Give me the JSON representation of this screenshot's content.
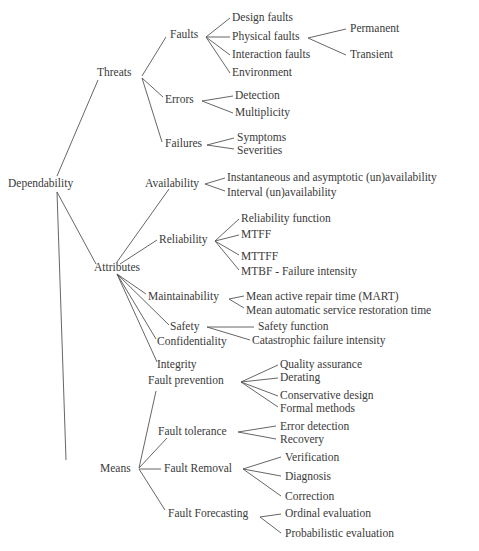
{
  "diagram": {
    "type": "tree",
    "title": "Dependability",
    "colors": {
      "text": "#3a3a3a",
      "lines": "#555555",
      "background": "#ffffff"
    },
    "nodes": [
      {
        "id": "dependability",
        "label": "Dependability",
        "x": 8,
        "y": 184
      },
      {
        "id": "threats",
        "label": "Threats",
        "x": 97,
        "y": 73
      },
      {
        "id": "faults",
        "label": "Faults",
        "x": 170,
        "y": 35
      },
      {
        "id": "design_faults",
        "label": "Design faults",
        "x": 232,
        "y": 18
      },
      {
        "id": "physical_faults",
        "label": "Physical faults",
        "x": 232,
        "y": 37
      },
      {
        "id": "interaction_faults",
        "label": "Interaction faults",
        "x": 232,
        "y": 55
      },
      {
        "id": "environment",
        "label": "Environment",
        "x": 232,
        "y": 73
      },
      {
        "id": "permanent",
        "label": "Permanent",
        "x": 350,
        "y": 29
      },
      {
        "id": "transient",
        "label": "Transient",
        "x": 350,
        "y": 55
      },
      {
        "id": "errors",
        "label": "Errors",
        "x": 165,
        "y": 100
      },
      {
        "id": "detection",
        "label": "Detection",
        "x": 235,
        "y": 96
      },
      {
        "id": "multiplicity",
        "label": "Multiplicity",
        "x": 235,
        "y": 113
      },
      {
        "id": "failures",
        "label": "Failures",
        "x": 165,
        "y": 144
      },
      {
        "id": "symptoms",
        "label": "Symptoms",
        "x": 237,
        "y": 138
      },
      {
        "id": "severities",
        "label": "Severities",
        "x": 237,
        "y": 151
      },
      {
        "id": "attributes",
        "label": "Attributes",
        "x": 94,
        "y": 268
      },
      {
        "id": "availability",
        "label": "Availability",
        "x": 145,
        "y": 184
      },
      {
        "id": "inst_avail",
        "label": "Instantaneous  and asymptotic (un)availability",
        "x": 227,
        "y": 178
      },
      {
        "id": "interval_avail",
        "label": "Interval (un)availability",
        "x": 227,
        "y": 193
      },
      {
        "id": "reliability",
        "label": "Reliability",
        "x": 159,
        "y": 240
      },
      {
        "id": "rel_function",
        "label": "Reliability function",
        "x": 241,
        "y": 219
      },
      {
        "id": "mtff",
        "label": "MTFF",
        "x": 241,
        "y": 235
      },
      {
        "id": "mttff",
        "label": "MTTFF",
        "x": 241,
        "y": 257
      },
      {
        "id": "mtbf",
        "label": "MTBF - Failure intensity",
        "x": 241,
        "y": 272
      },
      {
        "id": "maintainability",
        "label": "Maintainability",
        "x": 148,
        "y": 297
      },
      {
        "id": "mart",
        "label": "Mean active repair time (MART)",
        "x": 246,
        "y": 297
      },
      {
        "id": "mean_auto",
        "label": "Mean automatic service restoration time",
        "x": 246,
        "y": 311
      },
      {
        "id": "safety",
        "label": "Safety",
        "x": 170,
        "y": 327
      },
      {
        "id": "safety_function",
        "label": "Safety function",
        "x": 258,
        "y": 327
      },
      {
        "id": "catastrophic",
        "label": "Catastrophic failure intensity",
        "x": 252,
        "y": 341
      },
      {
        "id": "confidentiality",
        "label": "Confidentiality",
        "x": 157,
        "y": 342
      },
      {
        "id": "integrity",
        "label": "Integrity",
        "x": 157,
        "y": 365
      },
      {
        "id": "means",
        "label": "Means",
        "x": 100,
        "y": 469
      },
      {
        "id": "fault_prevention",
        "label": "Fault prevention",
        "x": 148,
        "y": 381
      },
      {
        "id": "quality_assurance",
        "label": "Quality assurance",
        "x": 280,
        "y": 365
      },
      {
        "id": "derating",
        "label": "Derating",
        "x": 280,
        "y": 378
      },
      {
        "id": "conservative_design",
        "label": "Conservative design",
        "x": 280,
        "y": 396
      },
      {
        "id": "formal_methods",
        "label": "Formal methods",
        "x": 280,
        "y": 409
      },
      {
        "id": "fault_tolerance",
        "label": "Fault tolerance",
        "x": 158,
        "y": 432
      },
      {
        "id": "error_detection",
        "label": "Error detection",
        "x": 280,
        "y": 427
      },
      {
        "id": "recovery",
        "label": "Recovery",
        "x": 280,
        "y": 440
      },
      {
        "id": "fault_removal",
        "label": "Fault Removal",
        "x": 164,
        "y": 469
      },
      {
        "id": "verification",
        "label": "Verification",
        "x": 285,
        "y": 458
      },
      {
        "id": "diagnosis",
        "label": "Diagnosis",
        "x": 285,
        "y": 477
      },
      {
        "id": "correction",
        "label": "Correction",
        "x": 285,
        "y": 497
      },
      {
        "id": "fault_forecasting",
        "label": "Fault Forecasting",
        "x": 168,
        "y": 514
      },
      {
        "id": "ordinal_eval",
        "label": "Ordinal evaluation",
        "x": 285,
        "y": 514
      },
      {
        "id": "probabilistic_eval",
        "label": "Probabilistic evaluation",
        "x": 285,
        "y": 534
      }
    ],
    "edges": [
      {
        "from": "dependability",
        "to": "threats",
        "x1": 57,
        "y1": 176,
        "x2": 98,
        "y2": 80
      },
      {
        "from": "dependability",
        "to": "attributes",
        "x1": 57,
        "y1": 192,
        "x2": 96,
        "y2": 264
      },
      {
        "from": "dependability",
        "to": "means",
        "x1": 57,
        "y1": 192,
        "x2": 66,
        "y2": 460
      },
      {
        "from": "threats",
        "to": "faults",
        "x1": 142,
        "y1": 76,
        "x2": 166,
        "y2": 37
      },
      {
        "from": "threats",
        "to": "errors",
        "x1": 142,
        "y1": 78,
        "x2": 163,
        "y2": 97
      },
      {
        "from": "threats",
        "to": "failures",
        "x1": 142,
        "y1": 78,
        "x2": 162,
        "y2": 142
      },
      {
        "from": "faults",
        "to": "design_faults",
        "x1": 206,
        "y1": 37,
        "x2": 230,
        "y2": 18
      },
      {
        "from": "faults",
        "to": "physical_faults",
        "x1": 206,
        "y1": 37,
        "x2": 230,
        "y2": 37
      },
      {
        "from": "faults",
        "to": "interaction_faults",
        "x1": 206,
        "y1": 37,
        "x2": 230,
        "y2": 55
      },
      {
        "from": "faults",
        "to": "environment",
        "x1": 206,
        "y1": 37,
        "x2": 230,
        "y2": 73
      },
      {
        "from": "physical_faults",
        "to": "permanent",
        "x1": 308,
        "y1": 38,
        "x2": 346,
        "y2": 29
      },
      {
        "from": "physical_faults",
        "to": "transient",
        "x1": 308,
        "y1": 38,
        "x2": 346,
        "y2": 55
      },
      {
        "from": "errors",
        "to": "detection",
        "x1": 202,
        "y1": 101,
        "x2": 233,
        "y2": 96
      },
      {
        "from": "errors",
        "to": "multiplicity",
        "x1": 202,
        "y1": 101,
        "x2": 233,
        "y2": 113
      },
      {
        "from": "failures",
        "to": "symptoms",
        "x1": 207,
        "y1": 145,
        "x2": 234,
        "y2": 138
      },
      {
        "from": "failures",
        "to": "severities",
        "x1": 207,
        "y1": 145,
        "x2": 234,
        "y2": 149
      },
      {
        "from": "attributes",
        "to": "availability",
        "x1": 117,
        "y1": 262,
        "x2": 169,
        "y2": 189
      },
      {
        "from": "attributes",
        "to": "reliability",
        "x1": 120,
        "y1": 264,
        "x2": 157,
        "y2": 240
      },
      {
        "from": "attributes",
        "to": "maintainability",
        "x1": 117,
        "y1": 274,
        "x2": 146,
        "y2": 294
      },
      {
        "from": "attributes",
        "to": "safety",
        "x1": 117,
        "y1": 274,
        "x2": 169,
        "y2": 325
      },
      {
        "from": "attributes",
        "to": "confidentiality",
        "x1": 117,
        "y1": 274,
        "x2": 156,
        "y2": 339
      },
      {
        "from": "attributes",
        "to": "integrity",
        "x1": 117,
        "y1": 274,
        "x2": 157,
        "y2": 362
      },
      {
        "from": "availability",
        "to": "inst_avail",
        "x1": 205,
        "y1": 184,
        "x2": 225,
        "y2": 178
      },
      {
        "from": "availability",
        "to": "interval_avail",
        "x1": 205,
        "y1": 184,
        "x2": 225,
        "y2": 191
      },
      {
        "from": "reliability",
        "to": "rel_function",
        "x1": 215,
        "y1": 241,
        "x2": 239,
        "y2": 219
      },
      {
        "from": "reliability",
        "to": "mtff",
        "x1": 215,
        "y1": 241,
        "x2": 239,
        "y2": 235
      },
      {
        "from": "reliability",
        "to": "mttff",
        "x1": 215,
        "y1": 241,
        "x2": 239,
        "y2": 255
      },
      {
        "from": "reliability",
        "to": "mtbf",
        "x1": 215,
        "y1": 241,
        "x2": 239,
        "y2": 270
      },
      {
        "from": "maintainability",
        "to": "mart",
        "x1": 229,
        "y1": 299,
        "x2": 244,
        "y2": 296
      },
      {
        "from": "maintainability",
        "to": "mean_auto",
        "x1": 229,
        "y1": 299,
        "x2": 244,
        "y2": 308
      },
      {
        "from": "safety",
        "to": "safety_function",
        "x1": 207,
        "y1": 327,
        "x2": 254,
        "y2": 327
      },
      {
        "from": "safety",
        "to": "catastrophic",
        "x1": 207,
        "y1": 327,
        "x2": 250,
        "y2": 340
      },
      {
        "from": "means",
        "to": "fault_prevention",
        "x1": 139,
        "y1": 468,
        "x2": 156,
        "y2": 391
      },
      {
        "from": "means",
        "to": "fault_tolerance",
        "x1": 139,
        "y1": 468,
        "x2": 167,
        "y2": 438
      },
      {
        "from": "means",
        "to": "fault_removal",
        "x1": 139,
        "y1": 469,
        "x2": 161,
        "y2": 469
      },
      {
        "from": "means",
        "to": "fault_forecasting",
        "x1": 139,
        "y1": 469,
        "x2": 165,
        "y2": 510
      },
      {
        "from": "fault_prevention",
        "to": "quality_assurance",
        "x1": 241,
        "y1": 382,
        "x2": 278,
        "y2": 365
      },
      {
        "from": "fault_prevention",
        "to": "derating",
        "x1": 241,
        "y1": 382,
        "x2": 278,
        "y2": 378
      },
      {
        "from": "fault_prevention",
        "to": "conservative_design",
        "x1": 241,
        "y1": 382,
        "x2": 278,
        "y2": 396
      },
      {
        "from": "fault_prevention",
        "to": "formal_methods",
        "x1": 241,
        "y1": 382,
        "x2": 278,
        "y2": 407
      },
      {
        "from": "fault_tolerance",
        "to": "error_detection",
        "x1": 238,
        "y1": 432,
        "x2": 276,
        "y2": 426
      },
      {
        "from": "fault_tolerance",
        "to": "recovery",
        "x1": 238,
        "y1": 432,
        "x2": 276,
        "y2": 439
      },
      {
        "from": "fault_removal",
        "to": "verification",
        "x1": 243,
        "y1": 469,
        "x2": 281,
        "y2": 457
      },
      {
        "from": "fault_removal",
        "to": "diagnosis",
        "x1": 243,
        "y1": 469,
        "x2": 281,
        "y2": 476
      },
      {
        "from": "fault_removal",
        "to": "correction",
        "x1": 243,
        "y1": 469,
        "x2": 281,
        "y2": 496
      },
      {
        "from": "fault_forecasting",
        "to": "ordinal_eval",
        "x1": 260,
        "y1": 517,
        "x2": 281,
        "y2": 514
      },
      {
        "from": "fault_forecasting",
        "to": "probabilistic_eval",
        "x1": 260,
        "y1": 517,
        "x2": 281,
        "y2": 533
      }
    ]
  }
}
